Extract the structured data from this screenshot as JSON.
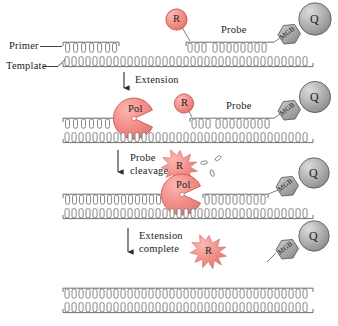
{
  "figure": {
    "type": "process-diagram"
  },
  "colors": {
    "reporter_fill": "#f4948f",
    "reporter_stroke": "#c9544f",
    "polymerase_fill": "#f2857f",
    "polymerase_stroke": "#cf5a54",
    "quencher_fill": "#a8a8a8",
    "quencher_stroke": "#5d5d5d",
    "mgb_fill": "#9e9e9e",
    "mgb_stroke": "#5d5d5d",
    "strand_stroke": "#6f6f6f",
    "text": "#1d1d1d",
    "background": "#ffffff"
  },
  "labels": {
    "primer": "Primer",
    "template": "Template",
    "probe": "Probe",
    "reporter": "R",
    "quencher": "Q",
    "mgb": "MGB",
    "polymerase": "Pol"
  },
  "steps": [
    {
      "id": "step-1-annealing",
      "arrow_label": "Extension",
      "arrow_label_lines": [
        "Extension"
      ]
    },
    {
      "id": "step-2-extension",
      "arrow_label": "Probe cleavage",
      "arrow_label_lines": [
        "Probe",
        "cleavage"
      ]
    },
    {
      "id": "step-3-cleavage",
      "arrow_label": "Extension complete",
      "arrow_label_lines": [
        "Extension",
        "complete"
      ]
    },
    {
      "id": "step-4-complete",
      "arrow_label": "",
      "arrow_label_lines": []
    }
  ],
  "panels": [
    {
      "name": "panel-annealing",
      "caption": "Primer and probe annealed to template",
      "elements": [
        "primer-strand",
        "probe-strand",
        "template-strand",
        "reporter-dye",
        "mgb-group",
        "quencher-dye"
      ]
    },
    {
      "name": "panel-extension",
      "caption": "Polymerase extends primer toward probe",
      "elements": [
        "primer-strand",
        "polymerase",
        "reporter-dye",
        "probe-strand",
        "template-strand",
        "mgb-group",
        "quencher-dye"
      ]
    },
    {
      "name": "panel-cleavage",
      "caption": "Polymerase 5' nuclease cleaves probe releasing reporter",
      "elements": [
        "primer-strand",
        "polymerase",
        "reporter-burst",
        "cleaved-nucleotides",
        "probe-strand",
        "template-strand",
        "mgb-group",
        "quencher-dye"
      ]
    },
    {
      "name": "panel-complete",
      "caption": "Extension complete, reporter separated from quencher",
      "elements": [
        "extended-strand",
        "template-strand",
        "reporter-burst",
        "mgb-group",
        "quencher-dye"
      ]
    }
  ],
  "icons": {
    "reporter_circle": "reporter-dye-icon",
    "reporter_star": "reporter-burst-icon",
    "quencher_circle": "quencher-dye-icon",
    "mgb_hexagon": "mgb-hexagon-icon",
    "polymerase_pacman": "polymerase-icon",
    "down_arrow": "down-arrow-icon",
    "nucleotide": "cleaved-nucleotide-icon"
  }
}
